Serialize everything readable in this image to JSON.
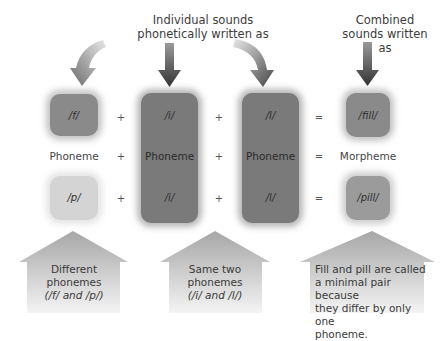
{
  "captions": {
    "individual": "Individual sounds phonetically written as",
    "combined": "Combined sounds written as"
  },
  "rows": {
    "top": [
      "/f/",
      "/i/",
      "/l/",
      "/fill/"
    ],
    "middle": [
      "Phoneme",
      "Phoneme",
      "Phoneme",
      "Morpheme"
    ],
    "bottom": [
      "/p/",
      "/i/",
      "/l/",
      "/pill/"
    ]
  },
  "operators": {
    "plus": "+",
    "equals": "="
  },
  "callouts": [
    {
      "text_line1": "Different phonemes",
      "text_line2": "(/f/ and /p/)"
    },
    {
      "text_line1": "Same two phonemes",
      "text_line2": "(/i/ and /l/)"
    },
    {
      "lines": [
        "Fill and pill are called",
        "a minimal pair because",
        "they differ by only one",
        "phoneme."
      ]
    }
  ],
  "icons": {
    "curved_arrow_left": "curved-arrow-down-left",
    "straight_arrow": "arrow-down",
    "curved_arrow_right": "curved-arrow-down-right",
    "house_arrow": "arrow-up-house"
  }
}
